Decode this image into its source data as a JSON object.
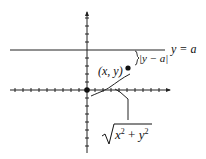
{
  "diagram": {
    "line_label": "y = a",
    "distance_label": "|y − a|",
    "point_label": "(x, y)",
    "radius_label": "√(x² + y²)",
    "radius_label_parts": {
      "x": "x",
      "x_exp": "2",
      "plus": " + ",
      "y": "y",
      "y_exp": "2"
    },
    "colors": {
      "ink": "#111111",
      "background": "#ffffff"
    }
  }
}
